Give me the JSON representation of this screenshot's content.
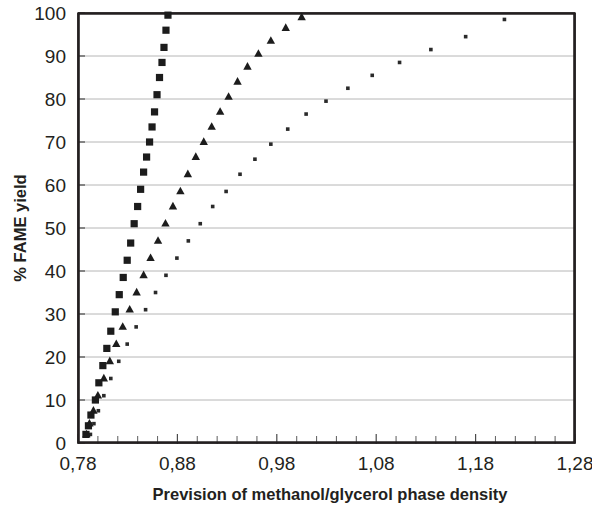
{
  "chart_data": {
    "type": "scatter",
    "title": "",
    "xlabel": "Prevision of methanol/glycerol phase density",
    "ylabel": "% FAME yield",
    "xlim": [
      0.78,
      1.28
    ],
    "ylim": [
      0,
      100
    ],
    "grid": "horizontal",
    "legend": "none",
    "decimal_separator": ",",
    "x_tick_labels": [
      "0,78",
      "0,88",
      "0,98",
      "1,08",
      "1,18",
      "1,28"
    ],
    "x_tick_values": [
      0.78,
      0.88,
      0.98,
      1.08,
      1.18,
      1.28
    ],
    "x_minor_tick_step": 0.02,
    "y_tick_labels": [
      "0",
      "10",
      "20",
      "30",
      "40",
      "50",
      "60",
      "70",
      "80",
      "90",
      "100"
    ],
    "y_tick_values": [
      0,
      10,
      20,
      30,
      40,
      50,
      60,
      70,
      80,
      90,
      100
    ],
    "series": [
      {
        "name": "series-squares",
        "marker": "square",
        "color": "#1c1c1c",
        "points": [
          [
            0.788,
            2.0
          ],
          [
            0.7905,
            4.0
          ],
          [
            0.793,
            6.5
          ],
          [
            0.7975,
            10.0
          ],
          [
            0.801,
            14.0
          ],
          [
            0.805,
            18.0
          ],
          [
            0.809,
            22.0
          ],
          [
            0.813,
            26.0
          ],
          [
            0.8175,
            30.5
          ],
          [
            0.8215,
            34.5
          ],
          [
            0.8255,
            38.5
          ],
          [
            0.8295,
            42.5
          ],
          [
            0.833,
            46.5
          ],
          [
            0.8365,
            51.0
          ],
          [
            0.84,
            55.0
          ],
          [
            0.843,
            59.0
          ],
          [
            0.846,
            63.0
          ],
          [
            0.849,
            66.5
          ],
          [
            0.852,
            70.0
          ],
          [
            0.8545,
            73.5
          ],
          [
            0.857,
            77.0
          ],
          [
            0.8595,
            81.0
          ],
          [
            0.862,
            85.0
          ],
          [
            0.8645,
            88.5
          ],
          [
            0.8665,
            92.0
          ],
          [
            0.8685,
            96.0
          ],
          [
            0.8705,
            99.5
          ]
        ]
      },
      {
        "name": "series-triangles",
        "marker": "triangle",
        "color": "#1c1c1c",
        "points": [
          [
            0.7885,
            2.0
          ],
          [
            0.7915,
            4.5
          ],
          [
            0.7955,
            7.5
          ],
          [
            0.8,
            11.0
          ],
          [
            0.806,
            15.0
          ],
          [
            0.812,
            19.0
          ],
          [
            0.8185,
            23.0
          ],
          [
            0.825,
            27.0
          ],
          [
            0.832,
            31.0
          ],
          [
            0.839,
            35.0
          ],
          [
            0.846,
            39.0
          ],
          [
            0.853,
            43.0
          ],
          [
            0.8605,
            47.0
          ],
          [
            0.868,
            51.0
          ],
          [
            0.8755,
            55.0
          ],
          [
            0.883,
            58.5
          ],
          [
            0.8905,
            62.5
          ],
          [
            0.8985,
            66.5
          ],
          [
            0.9065,
            70.0
          ],
          [
            0.9145,
            73.5
          ],
          [
            0.923,
            77.0
          ],
          [
            0.9315,
            80.5
          ],
          [
            0.9405,
            84.0
          ],
          [
            0.9505,
            87.5
          ],
          [
            0.9615,
            90.5
          ],
          [
            0.974,
            93.5
          ],
          [
            0.989,
            96.5
          ],
          [
            1.005,
            99.0
          ]
        ]
      },
      {
        "name": "series-dots",
        "marker": "dot",
        "color": "#2a2a2a",
        "points": [
          [
            0.7925,
            2.0
          ],
          [
            0.796,
            4.5
          ],
          [
            0.8005,
            7.5
          ],
          [
            0.806,
            11.0
          ],
          [
            0.813,
            15.0
          ],
          [
            0.821,
            19.0
          ],
          [
            0.8295,
            23.0
          ],
          [
            0.8385,
            27.0
          ],
          [
            0.848,
            31.0
          ],
          [
            0.858,
            35.0
          ],
          [
            0.8685,
            39.0
          ],
          [
            0.8795,
            43.0
          ],
          [
            0.891,
            47.0
          ],
          [
            0.903,
            51.0
          ],
          [
            0.9155,
            55.0
          ],
          [
            0.929,
            58.5
          ],
          [
            0.943,
            62.5
          ],
          [
            0.958,
            66.0
          ],
          [
            0.974,
            69.5
          ],
          [
            0.991,
            73.0
          ],
          [
            1.0095,
            76.5
          ],
          [
            1.0295,
            79.5
          ],
          [
            1.0515,
            82.5
          ],
          [
            1.076,
            85.5
          ],
          [
            1.1035,
            88.5
          ],
          [
            1.135,
            91.5
          ],
          [
            1.17,
            94.5
          ],
          [
            1.209,
            98.5
          ]
        ]
      }
    ]
  },
  "axes": {
    "x_title": "Prevision of methanol/glycerol phase density",
    "y_title": "% FAME yield"
  }
}
